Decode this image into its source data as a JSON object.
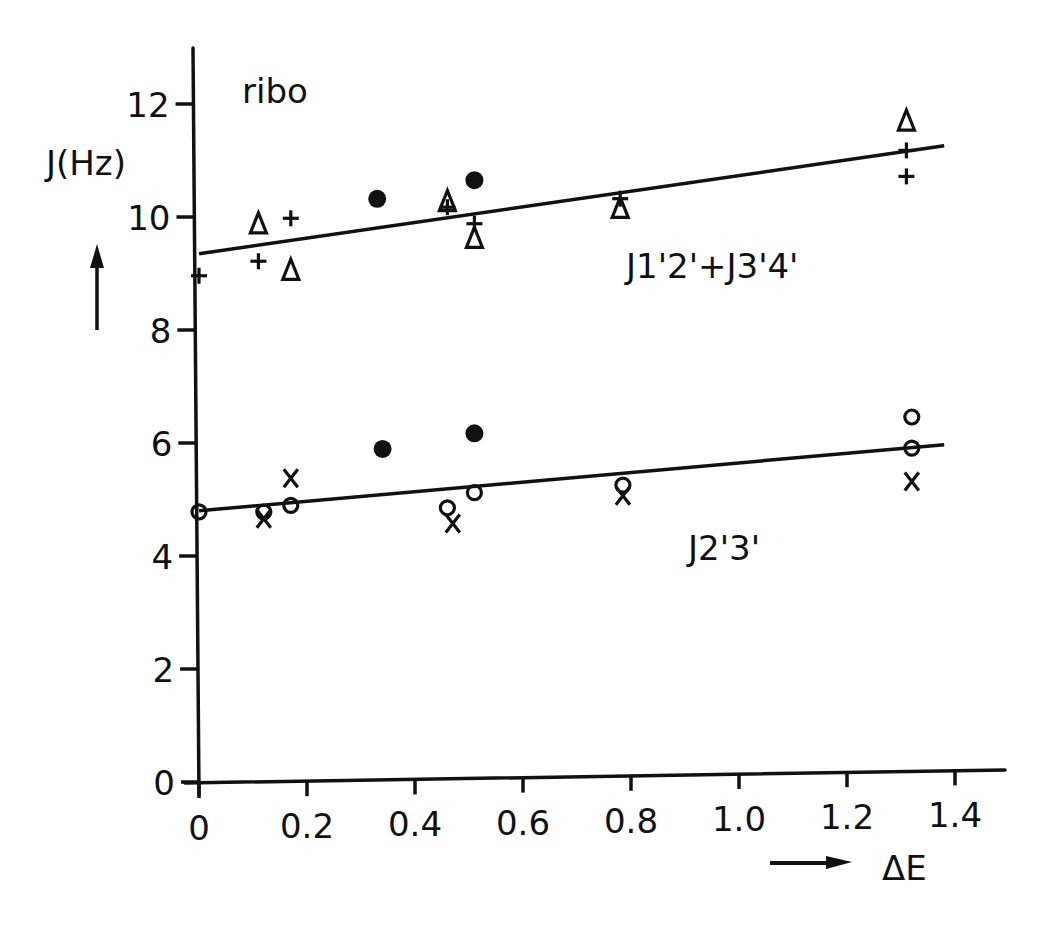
{
  "chart_data": {
    "type": "scatter",
    "title": "ribo",
    "xlabel": "ΔE",
    "ylabel": "J(Hz)",
    "xlim": [
      0,
      1.4
    ],
    "ylim": [
      0,
      13
    ],
    "grid": false,
    "x_ticks": [
      0,
      0.2,
      0.4,
      0.6,
      0.8,
      1.0,
      1.2,
      1.4
    ],
    "x_tick_labels": [
      "0",
      "0.2",
      "0.4",
      "0.6",
      "0.8",
      "1.0",
      "1.2",
      "1.4"
    ],
    "y_ticks": [
      0,
      2,
      4,
      6,
      8,
      10,
      12
    ],
    "y_tick_labels": [
      "0",
      "2",
      "4",
      "6",
      "8",
      "10",
      "12"
    ],
    "annotations": [
      {
        "text": "ribo",
        "x": 0.08,
        "y": 12.0
      },
      {
        "text": "J1'2'+J3'4'",
        "x": 0.78,
        "y": 9.2
      },
      {
        "text": "J2'3'",
        "x": 0.91,
        "y": 4.55
      }
    ],
    "fit_lines": [
      {
        "name": "J1'2'+J3'4'",
        "x": [
          0.0,
          1.38
        ],
        "y": [
          9.35,
          11.04
        ]
      },
      {
        "name": "J2'3'",
        "x": [
          0.0,
          1.38
        ],
        "y": [
          4.8,
          5.75
        ]
      }
    ],
    "series": [
      {
        "name": "triangle",
        "marker": "triangle-open",
        "points": [
          {
            "x": 0.11,
            "y": 9.86
          },
          {
            "x": 0.17,
            "y": 9.03
          },
          {
            "x": 0.46,
            "y": 10.2
          },
          {
            "x": 0.51,
            "y": 9.54
          },
          {
            "x": 0.78,
            "y": 10.03
          },
          {
            "x": 1.31,
            "y": 11.49
          }
        ]
      },
      {
        "name": "plus",
        "marker": "plus",
        "points": [
          {
            "x": 0.0,
            "y": 8.96
          },
          {
            "x": 0.11,
            "y": 9.2
          },
          {
            "x": 0.17,
            "y": 9.95
          },
          {
            "x": 0.46,
            "y": 10.1
          },
          {
            "x": 0.51,
            "y": 9.8
          },
          {
            "x": 0.78,
            "y": 10.2
          },
          {
            "x": 1.31,
            "y": 10.97
          },
          {
            "x": 1.31,
            "y": 10.51
          }
        ]
      },
      {
        "name": "filled-circle",
        "marker": "circle-filled",
        "points": [
          {
            "x": 0.33,
            "y": 10.27
          },
          {
            "x": 0.51,
            "y": 10.57
          },
          {
            "x": 0.34,
            "y": 5.84
          },
          {
            "x": 0.51,
            "y": 6.09
          }
        ]
      },
      {
        "name": "open-circle",
        "marker": "circle-open",
        "points": [
          {
            "x": 0.0,
            "y": 4.78
          },
          {
            "x": 0.12,
            "y": 4.76
          },
          {
            "x": 0.17,
            "y": 4.87
          },
          {
            "x": 0.46,
            "y": 4.78
          },
          {
            "x": 0.51,
            "y": 5.04
          },
          {
            "x": 0.785,
            "y": 5.13
          },
          {
            "x": 1.32,
            "y": 6.25
          },
          {
            "x": 1.32,
            "y": 5.7
          }
        ]
      },
      {
        "name": "cross",
        "marker": "x",
        "points": [
          {
            "x": 0.12,
            "y": 4.64
          },
          {
            "x": 0.17,
            "y": 5.35
          },
          {
            "x": 0.47,
            "y": 4.5
          },
          {
            "x": 0.785,
            "y": 4.94
          },
          {
            "x": 1.32,
            "y": 5.11
          }
        ]
      }
    ]
  },
  "labels": {
    "title": "ribo",
    "ylabel": "J(Hz)",
    "xlabel": "ΔE",
    "line1": "J1'2'+J3'4'",
    "line2": "J2'3'"
  }
}
